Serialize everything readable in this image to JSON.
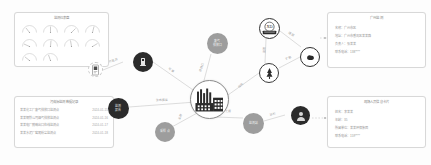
{
  "diagram": {
    "hub": {
      "name": "工厂",
      "icon": "factory-icon"
    },
    "nodes": [
      {
        "id": "device",
        "label": "",
        "icon": "meter-device-icon",
        "style": "dashed",
        "x": 88,
        "y": 62,
        "size": 15
      },
      {
        "id": "sensor",
        "label": "传感器",
        "icon": "sensor-icon",
        "style": "dark",
        "x": 133,
        "y": 52,
        "size": 20
      },
      {
        "id": "emission",
        "label": "废气\n排放口",
        "icon": "",
        "style": "gray",
        "x": 207,
        "y": 33,
        "size": 21
      },
      {
        "id": "badge",
        "label": "环保局",
        "icon": "badge-icon",
        "style": "ring",
        "x": 259,
        "y": 18,
        "size": 21
      },
      {
        "id": "cloud",
        "label": "",
        "icon": "cloud-icon",
        "style": "ring",
        "x": 300,
        "y": 47,
        "size": 20
      },
      {
        "id": "tree",
        "label": "",
        "icon": "tree-icon",
        "style": "white",
        "x": 259,
        "y": 63,
        "size": 20
      },
      {
        "id": "report",
        "label": "监测\n报告",
        "icon": "",
        "style": "dark",
        "x": 108,
        "y": 98,
        "size": 21
      },
      {
        "id": "sample",
        "label": "采样点",
        "icon": "",
        "style": "gray",
        "x": 155,
        "y": 122,
        "size": 20
      },
      {
        "id": "station",
        "label": "监测站",
        "icon": "",
        "style": "gray",
        "x": 243,
        "y": 113,
        "size": 21
      },
      {
        "id": "inspector",
        "label": "",
        "icon": "person-icon",
        "style": "dark",
        "x": 291,
        "y": 106,
        "size": 19
      }
    ],
    "edges": [
      {
        "from": "device",
        "to": "sensor",
        "label": "实时监测"
      },
      {
        "from": "sensor",
        "to": "hub",
        "label": "安装"
      },
      {
        "from": "hub",
        "to": "emission",
        "label": "排放口"
      },
      {
        "from": "hub",
        "to": "tree",
        "label": "绿化"
      },
      {
        "from": "tree",
        "to": "cloud",
        "label": "扩散"
      },
      {
        "from": "badge",
        "to": "tree",
        "label": "监管"
      },
      {
        "from": "badge",
        "to": "cloud",
        "label": "通报"
      },
      {
        "from": "hub",
        "to": "report",
        "label": "生成报告"
      },
      {
        "from": "hub",
        "to": "sample",
        "label": "采样"
      },
      {
        "from": "hub",
        "to": "station",
        "label": "上报"
      },
      {
        "from": "station",
        "to": "inspector",
        "label": "巡检"
      }
    ]
  },
  "gauge_panel": {
    "title": "监测仪表盘",
    "gauges": [
      {
        "name": "gauge-1",
        "value": 62
      },
      {
        "name": "gauge-2",
        "value": 48
      },
      {
        "name": "gauge-3",
        "value": 75
      },
      {
        "name": "gauge-4",
        "value": 55
      },
      {
        "name": "gauge-5",
        "value": 30
      },
      {
        "name": "gauge-6",
        "value": 58
      },
      {
        "name": "gauge-7",
        "value": 50
      },
      {
        "name": "gauge-8",
        "value": 80
      },
      {
        "name": "gauge-9",
        "value": 35
      },
      {
        "name": "gauge-10",
        "value": 45
      }
    ]
  },
  "table_panel": {
    "title": "污染源监测数据记录",
    "rows": [
      {
        "label": "某某化工厂废气排放口监测点",
        "value": "2024-01-15"
      },
      {
        "label": "某某钢铁公司烟气排放监测点",
        "value": "2024-01-16"
      },
      {
        "label": "某某电厂脱硫出口在线监测点",
        "value": "2024-01-17"
      },
      {
        "label": "某某水泥厂窑尾粉尘监测点",
        "value": "2024-01-18"
      }
    ]
  },
  "info_panel_top": {
    "title": "广州监测",
    "rows": [
      "名称：广州市区",
      "地址：广州市番禺区某某路",
      "负责人：张某某",
      "联系电话：138****"
    ]
  },
  "info_panel_bottom": {
    "title": "现场人员信息卡片",
    "rows": [
      "姓名：李某某",
      "年龄：35",
      "所属单位：某某环保集团",
      "联系电话：159****"
    ]
  }
}
